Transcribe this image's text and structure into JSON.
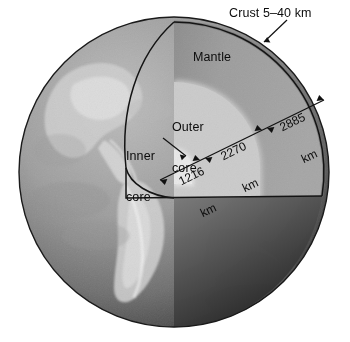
{
  "figure": {
    "background_color": "#ffffff"
  },
  "labels": {
    "crust": "Crust 5–40 km",
    "mantle": "Mantle",
    "outer_core_line1": "Outer",
    "outer_core_line2": "core",
    "inner_core_line1": "Inner",
    "inner_core_line2": "core"
  },
  "dimensions": [
    {
      "name": "inner-core-radius",
      "value": "1216",
      "unit": "km"
    },
    {
      "name": "outer-core-thickness",
      "value": "2270",
      "unit": "km"
    },
    {
      "name": "mantle-thickness",
      "value": "2885",
      "unit": "km"
    }
  ],
  "colors": {
    "globe_light": "#a9a9a9",
    "globe_dark": "#3c3c3c",
    "mantle": "#9b9b9b",
    "mantle_shadow": "#8a8a8a",
    "outer_core": "#c8c8c8",
    "inner_core": "#e4e4e4",
    "outline": "#121212",
    "text": "#0c0c0c"
  }
}
